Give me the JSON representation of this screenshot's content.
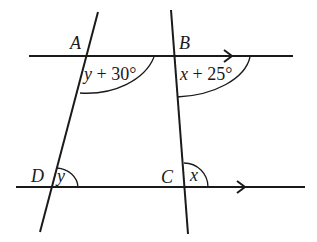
{
  "diagram": {
    "type": "parallel-lines-with-transversals",
    "points": {
      "A": "A",
      "B": "B",
      "C": "C",
      "D": "D"
    },
    "angles": {
      "angle_A": {
        "var": "y",
        "op": " + ",
        "num": "30°"
      },
      "angle_B": {
        "var": "x",
        "op": " + ",
        "num": "25°"
      },
      "angle_D": {
        "var": "y"
      },
      "angle_C": {
        "var": "x"
      }
    },
    "parallel_marks": [
      "top-line-arrow",
      "bottom-line-arrow"
    ],
    "line_color": "#1a1a1a"
  }
}
